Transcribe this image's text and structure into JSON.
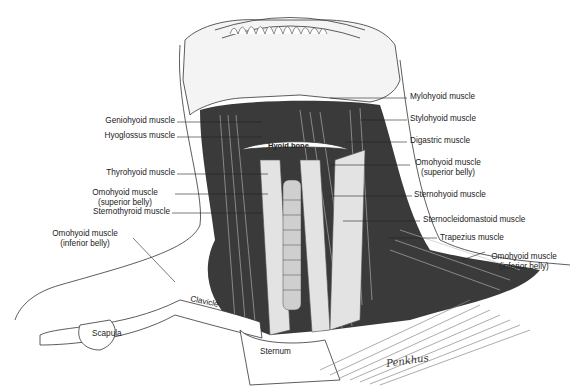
{
  "figure": {
    "signature": "Penkhus",
    "labels_left": [
      {
        "id": "geniohyoid",
        "text": "Geniohyoid muscle"
      },
      {
        "id": "hyoglossus",
        "text": "Hyoglossus muscle"
      },
      {
        "id": "thyrohyoid",
        "text": "Thyrohyoid muscle"
      },
      {
        "id": "omohyoid_sup_l",
        "line1": "Omohyoid muscle",
        "line2": "(superior belly)"
      },
      {
        "id": "sternothyroid",
        "text": "Sternothyroid muscle"
      },
      {
        "id": "omohyoid_inf_l",
        "line1": "Omohyoid muscle",
        "line2": "(inferior belly)"
      }
    ],
    "labels_right": [
      {
        "id": "mylohyoid",
        "text": "Mylohyoid muscle"
      },
      {
        "id": "stylohyoid",
        "text": "Stylohyoid muscle"
      },
      {
        "id": "digastric",
        "text": "Digastric muscle"
      },
      {
        "id": "omohyoid_sup_r",
        "line1": "Omohyoid muscle",
        "line2": "(superior belly)"
      },
      {
        "id": "sternohyoid",
        "text": "Sternohyoid muscle"
      },
      {
        "id": "sternocleidomastoid",
        "text": "Sternocleidomastoid muscle"
      },
      {
        "id": "trapezius",
        "text": "Trapezius muscle"
      },
      {
        "id": "omohyoid_inf_r",
        "line1": "Omohyoid muscle",
        "line2": "(inferior belly)"
      }
    ],
    "labels_inline": {
      "hyoid_bone": "Hyoid bone",
      "clavicle": "Clavicle",
      "scapula": "Scapula",
      "sternum": "Sternum"
    }
  }
}
